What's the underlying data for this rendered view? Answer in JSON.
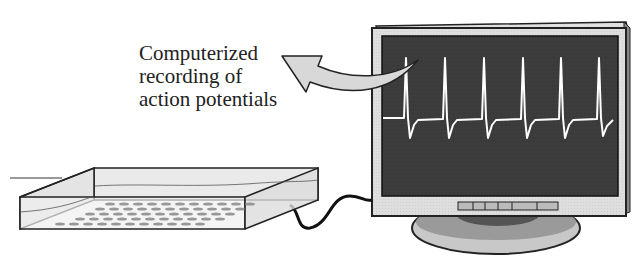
{
  "caption": {
    "lines": [
      "Computerized",
      "recording of",
      "action potentials"
    ]
  },
  "figure": {
    "elements": [
      "curved-arrow",
      "monitor",
      "action-potential-trace",
      "multielectrode-array-dish",
      "cable"
    ],
    "trace": {
      "spike_count": 5,
      "trace_color": "#ffffff",
      "screen_color": "#3a3a3a"
    },
    "monitor_buttons": 6
  }
}
